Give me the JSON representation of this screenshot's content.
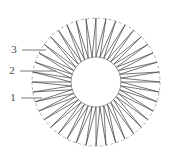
{
  "figure": {
    "name": "annular-wedge-ring-diagram",
    "canvas": {
      "width": 172,
      "height": 161,
      "background": "#ffffff"
    },
    "geometry": {
      "center_x": 96,
      "center_y": 82,
      "outer_radius": 64,
      "inner_radius": 25,
      "wedge_count": 40
    },
    "outer_circle": {
      "style": "dashed",
      "stroke": "#8c8c8c",
      "stroke_width": 0.7,
      "dash_pattern": "3 2.5"
    },
    "inner_circle": {
      "style": "solid",
      "stroke": "#6e6e6e",
      "stroke_width": 0.7
    },
    "wedges": {
      "stroke": "#3c3c3c",
      "stroke_width": 0.7,
      "fill": "none",
      "description": "radial tapered sawtooth wedges spanning outer to inner circle"
    }
  },
  "callouts": [
    {
      "id": "callout-3",
      "label": "3",
      "label_x": 14,
      "label_y": 50,
      "leader_x1": 22,
      "leader_y1": 50,
      "leader_x2": 46,
      "leader_y2": 50,
      "stroke": "#7a7a7a"
    },
    {
      "id": "callout-2",
      "label": "2",
      "label_x": 12,
      "label_y": 71,
      "leader_x1": 20,
      "leader_y1": 71,
      "leader_x2": 56,
      "leader_y2": 71,
      "stroke": "#7a7a7a"
    },
    {
      "id": "callout-1",
      "label": "1",
      "label_x": 13,
      "label_y": 98,
      "leader_x1": 21,
      "leader_y1": 98,
      "leader_x2": 42,
      "leader_y2": 98,
      "stroke": "#7a7a7a"
    }
  ]
}
